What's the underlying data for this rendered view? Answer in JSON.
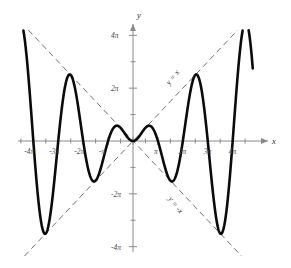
{
  "chart_data": {
    "type": "line",
    "title": "",
    "subtitle": "",
    "xlabel": "x",
    "ylabel": "y",
    "function_label": "y = x sin x",
    "xlim": [
      -14.5,
      15.2
    ],
    "ylim": [
      -13.2,
      13.2
    ],
    "grid": false,
    "legend_position": "inline-annotations",
    "x_tick_labels": [
      "-4π",
      "-3π",
      "-2π",
      "-π",
      "π",
      "2π",
      "3π",
      "4π"
    ],
    "x_tick_values": [
      -12.566,
      -9.425,
      -6.283,
      -3.142,
      3.142,
      6.283,
      9.425,
      12.566
    ],
    "x_minor_tick_step_label": "π/2",
    "y_tick_labels": [
      "4π",
      "2π",
      "-2π",
      "-4π"
    ],
    "y_tick_values": [
      12.566,
      6.283,
      -6.283,
      -12.566
    ],
    "y_minor_tick_step_label": "π",
    "series": [
      {
        "name": "y = x sin x",
        "color": "#0b0b0b",
        "style": "solid",
        "x": [
          -14.5,
          -14.2,
          -13.9,
          -13.6,
          -13.3,
          -13.0,
          -12.7,
          -12.4,
          -12.1,
          -11.8,
          -11.5,
          -11.2,
          -10.9,
          -10.6,
          -10.3,
          -10.0,
          -9.7,
          -9.4,
          -9.1,
          -8.8,
          -8.5,
          -8.2,
          -7.9,
          -7.6,
          -7.3,
          -7.0,
          -6.7,
          -6.4,
          -6.1,
          -5.8,
          -5.5,
          -5.2,
          -4.9,
          -4.6,
          -4.3,
          -4.0,
          -3.7,
          -3.4,
          -3.1,
          -2.8,
          -2.5,
          -2.2,
          -1.9,
          -1.6,
          -1.3,
          -1.0,
          -0.7,
          -0.4,
          -0.1,
          0.0,
          0.1,
          0.4,
          0.7,
          1.0,
          1.3,
          1.6,
          1.9,
          2.2,
          2.5,
          2.8,
          3.1,
          3.4,
          3.7,
          4.0,
          4.3,
          4.6,
          4.9,
          5.2,
          5.5,
          5.8,
          6.1,
          6.4,
          6.7,
          7.0,
          7.3,
          7.6,
          7.9,
          8.2,
          8.5,
          8.8,
          9.1,
          9.4,
          9.7,
          10.0,
          10.3,
          10.6,
          10.9,
          11.2,
          11.5,
          11.8,
          12.1,
          12.4,
          12.7,
          13.0,
          13.3,
          13.6,
          13.9,
          14.2,
          14.5,
          14.8,
          15.1
        ],
        "y": [
          -14.5,
          -13.3,
          -11.2,
          -8.3,
          -5.0,
          -1.5,
          1.9,
          5.1,
          7.8,
          9.9,
          11.3,
          11.9,
          11.7,
          10.7,
          9.0,
          6.7,
          4.0,
          1.1,
          -1.8,
          -4.6,
          -7.0,
          -8.8,
          -9.9,
          -10.2,
          -9.7,
          -8.4,
          -6.5,
          -4.1,
          -1.4,
          1.4,
          4.0,
          6.2,
          7.8,
          8.7,
          8.8,
          8.0,
          6.5,
          4.4,
          2.0,
          -0.5,
          -2.8,
          -4.7,
          -6.0,
          -6.5,
          -6.2,
          -5.1,
          -3.3,
          -1.1,
          0.3,
          0.0,
          0.3,
          1.1,
          3.3,
          5.1,
          6.2,
          6.5,
          6.0,
          4.7,
          2.8,
          0.5,
          -2.0,
          -4.4,
          -6.5,
          -8.0,
          -8.8,
          -8.7,
          -7.8,
          -6.2,
          -4.0,
          -1.4,
          1.4,
          4.1,
          6.5,
          8.4,
          9.7,
          10.2,
          9.9,
          8.8,
          7.0,
          4.6,
          1.8,
          -1.1,
          -4.0,
          -6.7,
          -9.0,
          -10.7,
          -11.7,
          -11.9,
          -11.3,
          -9.9,
          -7.8,
          -5.1,
          -1.9,
          1.5,
          5.0,
          8.3,
          11.2,
          13.3,
          14.5,
          14.8,
          14.1
        ]
      },
      {
        "name": "y = x",
        "color": "#6f6f6f",
        "style": "dashed",
        "annotation": "y = x",
        "x": [
          -14.5,
          15.1
        ],
        "y": [
          -14.5,
          15.1
        ]
      },
      {
        "name": "y = -x",
        "color": "#6f6f6f",
        "style": "dashed",
        "annotation": "y = -x",
        "x": [
          -14.5,
          15.1
        ],
        "y": [
          14.5,
          -15.1
        ]
      }
    ],
    "annotations": [
      {
        "text": "y = x",
        "x": 4.6,
        "y": 6.6,
        "rotation": -52
      },
      {
        "text": "y = -x",
        "x": 4.4,
        "y": -6.9,
        "rotation": 52
      }
    ]
  },
  "axes": {
    "x_axis_name": "x",
    "y_axis_name": "y"
  }
}
